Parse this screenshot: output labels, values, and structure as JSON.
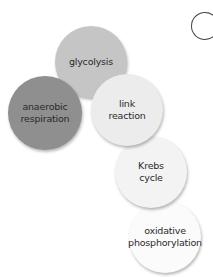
{
  "diagram": {
    "type": "overlapping-circles",
    "topic": "stages of respiration",
    "corner_label": "C",
    "nodes": [
      {
        "id": "anaerobic",
        "label": "anaerobic\nrespiration",
        "color": "#8f8f8f",
        "cx": 45,
        "cy": 113,
        "r": 37
      },
      {
        "id": "glycolysis",
        "label": "glycolysis",
        "color": "#c5c5c5",
        "cx": 91,
        "cy": 62,
        "r": 36
      },
      {
        "id": "link",
        "label": "link\nreaction",
        "color": "#ececec",
        "cx": 127,
        "cy": 110,
        "r": 36
      },
      {
        "id": "krebs",
        "label": "Krebs\ncycle",
        "color": "#f3f3f3",
        "cx": 151,
        "cy": 172,
        "r": 36
      },
      {
        "id": "oxphos",
        "label": "oxidative\nphosphorylation",
        "color": "#fbfbfb",
        "cx": 165,
        "cy": 237,
        "r": 36
      }
    ]
  }
}
